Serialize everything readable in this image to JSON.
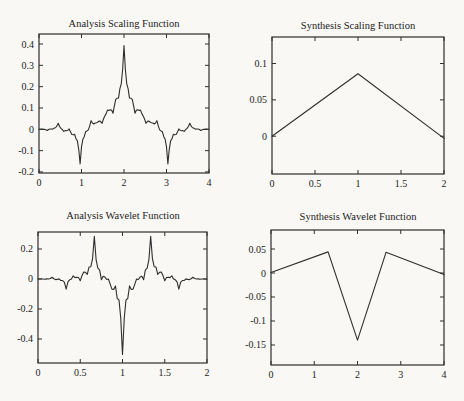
{
  "figure": {
    "background": "#f9f8f5",
    "line_color": "#2e2e2e",
    "text_color": "#1c1c1c",
    "rows": 2,
    "cols": 2
  },
  "chart_data": [
    {
      "type": "line",
      "name": "analysis-scaling-function",
      "title": "Analysis Scaling Function",
      "xlim": [
        0,
        4
      ],
      "ylim": [
        -0.205,
        0.447
      ],
      "xticks": [
        0,
        1,
        2,
        3,
        4
      ],
      "xticklabels": [
        "0",
        "1",
        "2",
        "3",
        "4"
      ],
      "yticks": [
        0.4,
        0.3,
        0.2,
        0.1,
        0,
        -0.1,
        -0.2
      ],
      "yticklabels": [
        "0.4",
        "0.3",
        "0.2",
        "0.1",
        "0",
        "-0.1",
        "-0.2"
      ],
      "grid": false,
      "series": [
        {
          "name": "analysis-scaling-curve",
          "y": [
            -0.0001,
            0.0002,
            0.0009,
            -0.0002,
            -0.0005,
            -0.0022,
            -0.0053,
            -0.0013,
            0.0016,
            0.0015,
            0.0009,
            0.0055,
            0.0073,
            0.0149,
            0.0281,
            0.0132,
            0.0043,
            -0.0007,
            -0.0096,
            -0.0064,
            -0.0067,
            -0.0048,
            0.0018,
            -0.0127,
            -0.0247,
            -0.0257,
            -0.0237,
            -0.0445,
            -0.0541,
            -0.095,
            -0.162,
            -0.0825,
            -0.0468,
            -0.0344,
            -0.0114,
            -0.0077,
            -0.0025,
            0.0162,
            0.0404,
            0.0294,
            0.0251,
            0.0292,
            0.0307,
            0.034,
            0.0387,
            0.036,
            0.0281,
            0.0482,
            0.062,
            0.0735,
            0.0904,
            0.0879,
            0.0922,
            0.089,
            0.0754,
            0.111,
            0.14,
            0.1458,
            0.1465,
            0.191,
            0.2133,
            0.2807,
            0.393,
            0.2807,
            0.2133,
            0.191,
            0.1465,
            0.1458,
            0.14,
            0.111,
            0.0754,
            0.089,
            0.0922,
            0.0879,
            0.0904,
            0.0735,
            0.062,
            0.0482,
            0.0281,
            0.036,
            0.0387,
            0.034,
            0.0307,
            0.0292,
            0.0251,
            0.0294,
            0.0404,
            0.0162,
            -0.0025,
            -0.0077,
            -0.0114,
            -0.0344,
            -0.0468,
            -0.0825,
            -0.162,
            -0.095,
            -0.0541,
            -0.0445,
            -0.0237,
            -0.0257,
            -0.0247,
            -0.0127,
            0.0018,
            -0.0048,
            -0.0067,
            -0.0064,
            -0.0096,
            -0.0007,
            0.0043,
            0.0132,
            0.0281,
            0.0149,
            0.0073,
            0.0055,
            0.0009,
            0.0015,
            0.0016,
            -0.0013,
            -0.0053,
            -0.0022,
            -0.0005,
            -0.0002,
            0.0009,
            0.0002,
            -0.0001
          ]
        }
      ]
    },
    {
      "type": "line",
      "name": "synthesis-scaling-function",
      "title": "Synthesis Scaling Function",
      "xlim": [
        0,
        2
      ],
      "ylim": [
        -0.052,
        0.1365
      ],
      "xticks": [
        0,
        0.5,
        1,
        1.5,
        2
      ],
      "xticklabels": [
        "0",
        "0.5",
        "1",
        "1.5",
        "2"
      ],
      "yticks": [
        0.1,
        0.05,
        0
      ],
      "yticklabels": [
        "0.1",
        "0.05",
        "0"
      ],
      "grid": false,
      "series": [
        {
          "name": "synthesis-scaling-curve",
          "x": [
            0,
            1,
            2
          ],
          "y": [
            0,
            0.086,
            -0.003
          ]
        }
      ]
    },
    {
      "type": "line",
      "name": "analysis-wavelet-function",
      "title": "Analysis Wavelet Function",
      "xlim": [
        0,
        2
      ],
      "ylim": [
        -0.56,
        0.3133
      ],
      "xticks": [
        0,
        0.5,
        1,
        1.5,
        2
      ],
      "xticklabels": [
        "0",
        "0.5",
        "1",
        "1.5",
        "2"
      ],
      "yticks": [
        0.2,
        0,
        -0.2,
        -0.4
      ],
      "yticklabels": [
        "0.2",
        "0",
        "-0.2",
        "-0.4"
      ],
      "grid": false,
      "series": [
        {
          "name": "analysis-wavelet-curve",
          "y": [
            0,
            0,
            0.0004,
            -0.0002,
            -0.0022,
            0.0007,
            0.0004,
            0.0031,
            0.0119,
            0.0018,
            -0.0041,
            -0.0028,
            0.0007,
            -0.0104,
            -0.01,
            -0.0229,
            -0.068,
            -0.0197,
            -0.0056,
            -0.0006,
            0.0215,
            0.0092,
            0.0122,
            0.0102,
            -0.0119,
            0.0226,
            0.0464,
            0.0447,
            0.0304,
            0.0801,
            0.082,
            0.136,
            0.285,
            0.1298,
            0.072,
            0.0611,
            -0.0045,
            0.0185,
            0.0126,
            -0.0034,
            0,
            -0.0342,
            -0.0675,
            -0.0702,
            -0.046,
            -0.13,
            -0.1388,
            -0.26,
            -0.503,
            -0.26,
            -0.1388,
            -0.13,
            -0.046,
            -0.0702,
            -0.0675,
            -0.0342,
            0,
            -0.0034,
            0.0126,
            0.0185,
            -0.0045,
            0.0611,
            0.072,
            0.1298,
            0.285,
            0.136,
            0.082,
            0.0801,
            0.0304,
            0.0447,
            0.0464,
            0.0226,
            -0.0119,
            0.0102,
            0.0122,
            0.0092,
            0.0215,
            -0.0006,
            -0.0056,
            -0.0197,
            -0.068,
            -0.0229,
            -0.01,
            -0.0104,
            0.0007,
            -0.0028,
            -0.0041,
            0.0018,
            0.0119,
            0.0031,
            0.0004,
            0.0007,
            -0.0022,
            -0.0002,
            0.0004,
            0,
            0
          ]
        }
      ]
    },
    {
      "type": "line",
      "name": "synthesis-wavelet-function",
      "title": "Synthesis Wavelet Function",
      "xlim": [
        0,
        4
      ],
      "ylim": [
        -0.1917,
        0.0896
      ],
      "xticks": [
        0,
        1,
        2,
        3,
        4
      ],
      "xticklabels": [
        "0",
        "1",
        "2",
        "3",
        "4"
      ],
      "yticks": [
        0.05,
        0,
        -0.05,
        -0.1,
        -0.15
      ],
      "yticklabels": [
        "0.05",
        "0",
        "-0.05",
        "-0.1",
        "-0.15"
      ],
      "grid": false,
      "series": [
        {
          "name": "synthesis-wavelet-curve",
          "x": [
            0,
            1.32,
            2,
            2.66,
            4
          ],
          "y": [
            0.001,
            0.044,
            -0.14,
            0.043,
            -0.003
          ]
        }
      ]
    }
  ]
}
